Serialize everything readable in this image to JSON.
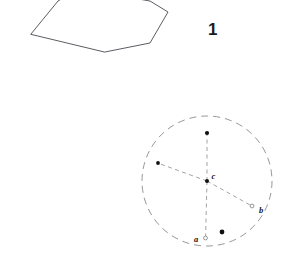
{
  "figure": {
    "number_label": "1",
    "background_color": "#ffffff",
    "width": 299,
    "height": 253,
    "stroke_color_solid": "#4a4a52",
    "stroke_color_dashed": "#8a8a90",
    "marker_fill": "#101014",
    "label_color": "#15151a"
  },
  "polygon": {
    "name": "irregular-polygon",
    "clipped_at_top": true,
    "stroke_width": 0.9,
    "vertices": [
      [
        31,
        34
      ],
      [
        58,
        1
      ],
      [
        70,
        -6
      ],
      [
        121,
        -4
      ],
      [
        150,
        1
      ],
      [
        168,
        12
      ],
      [
        150,
        43
      ],
      [
        105,
        52
      ]
    ],
    "points_attr": "31,34 58,1 70,-6 121,-4 150,1 168,12 150,43 105,52"
  },
  "circle_diagram": {
    "name": "dashed-circle-diagram",
    "center": {
      "x": 207,
      "y": 181
    },
    "radius": 65,
    "dash_pattern": "7 5",
    "stroke_width": 0.9,
    "clipped_at_bottom": true,
    "center_label": "c",
    "center_label_pos": {
      "x": 211.5,
      "y": 178
    },
    "radii": [
      {
        "name": "radius-up",
        "endpoint": {
          "x": 207,
          "y": 133
        },
        "marker": "filled-dot",
        "label": ""
      },
      {
        "name": "radius-upper-left",
        "endpoint": {
          "x": 158,
          "y": 163
        },
        "marker": "filled-dot",
        "label": ""
      },
      {
        "name": "radius-lower-right",
        "endpoint": {
          "x": 252,
          "y": 206
        },
        "marker": "open-dot",
        "label": "b",
        "label_pos": {
          "x": 259,
          "y": 212
        }
      },
      {
        "name": "radius-down",
        "endpoint": {
          "x": 205.5,
          "y": 238
        },
        "marker": "open-dot",
        "label": "a",
        "label_pos": {
          "x": 194,
          "y": 241
        }
      }
    ],
    "free_point": {
      "name": "free-dot",
      "x": 222,
      "y": 232,
      "marker": "filled-dot"
    }
  }
}
